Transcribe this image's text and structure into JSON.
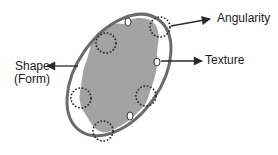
{
  "labels": {
    "angularity": "Angularity",
    "texture": "Texture",
    "shape_line1": "Shape",
    "shape_line2": "(Form)"
  },
  "colors": {
    "particle_fill": "#a3a3a3",
    "outline": "#6b6b6b",
    "dotted": "#222222",
    "arrow": "#2a2a2a",
    "background": "#ffffff"
  },
  "elements": {
    "envelope_ellipse": {
      "cx": 119,
      "cy": 75,
      "rx": 42,
      "ry": 68,
      "rotate": 35
    },
    "angularity_circles": [
      {
        "cx": 160,
        "cy": 27,
        "r": 10
      },
      {
        "cx": 106,
        "cy": 43,
        "r": 10
      },
      {
        "cx": 81,
        "cy": 98,
        "r": 10
      },
      {
        "cx": 146,
        "cy": 96,
        "r": 10
      },
      {
        "cx": 103,
        "cy": 131,
        "r": 10
      }
    ],
    "texture_ellipses": [
      {
        "cx": 128,
        "cy": 22,
        "rx": 3,
        "ry": 4
      },
      {
        "cx": 157,
        "cy": 62,
        "rx": 3,
        "ry": 4
      },
      {
        "cx": 130,
        "cy": 116,
        "rx": 3,
        "ry": 4
      }
    ]
  }
}
